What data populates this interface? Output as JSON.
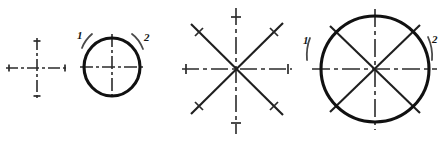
{
  "figure": {
    "background_color": "#ffffff",
    "ink_color": "#111111",
    "center_line_color": "#2b2b2b",
    "hint_arc_color": "#4a4a4a",
    "width": 443,
    "height": 150
  },
  "panels": [
    {
      "id": "panel-1",
      "name": "center-cross",
      "caption": "",
      "center": {
        "x": 37,
        "y": 68
      },
      "horizontal_line": {
        "x1": 6,
        "x2": 68,
        "y": 68
      },
      "vertical_line": {
        "y1": 38,
        "y2": 99,
        "x": 37
      },
      "dash_pattern": "12 3 3 3",
      "ticks": [
        {
          "name": "tick-left",
          "x": 9,
          "y": 68,
          "orientation": "vertical",
          "length": 7
        },
        {
          "name": "tick-right",
          "x": 65,
          "y": 68,
          "orientation": "vertical",
          "length": 7
        },
        {
          "name": "tick-top",
          "x": 37,
          "y": 41,
          "orientation": "horizontal",
          "length": 7
        },
        {
          "name": "tick-bottom",
          "x": 37,
          "y": 96,
          "orientation": "horizontal",
          "length": 7
        }
      ],
      "labels": [],
      "circle": null,
      "diagonals": []
    },
    {
      "id": "panel-2",
      "name": "circle-over-cross",
      "caption": "",
      "center": {
        "x": 112,
        "y": 67
      },
      "horizontal_line": {
        "x1": 80,
        "x2": 146,
        "y": 67
      },
      "vertical_line": {
        "y1": 34,
        "y2": 100,
        "x": 112
      },
      "dash_pattern": "12 3 3 3",
      "ticks": [],
      "circle": {
        "cx": 112,
        "cy": 67,
        "rx": 28,
        "ry": 29
      },
      "diagonals": [],
      "labels": [
        {
          "text": "1",
          "x": 77,
          "y": 39,
          "arc": "left-top"
        },
        {
          "text": "2",
          "x": 144,
          "y": 41,
          "arc": "right-top"
        }
      ]
    },
    {
      "id": "panel-3",
      "name": "eight-ray-star",
      "caption": "",
      "center": {
        "x": 236,
        "y": 69
      },
      "horizontal_line": {
        "x1": 182,
        "x2": 292,
        "y": 69
      },
      "vertical_line": {
        "y1": 8,
        "y2": 134,
        "x": 236
      },
      "dash_pattern": "16 4 4 4",
      "ticks": [
        {
          "name": "tick-left",
          "x": 186,
          "y": 69,
          "orientation": "vertical",
          "length": 10
        },
        {
          "name": "tick-right",
          "x": 288,
          "y": 69,
          "orientation": "vertical",
          "length": 10
        },
        {
          "name": "tick-top",
          "x": 236,
          "y": 17,
          "orientation": "horizontal",
          "length": 10
        },
        {
          "name": "tick-bottom",
          "x": 236,
          "y": 123,
          "orientation": "horizontal",
          "length": 10
        }
      ],
      "circle": null,
      "diagonals": [
        {
          "name": "diagonal-nw-se",
          "x1": 191,
          "y1": 24,
          "x2": 283,
          "y2": 115
        },
        {
          "name": "diagonal-sw-ne",
          "x1": 191,
          "y1": 114,
          "x2": 283,
          "y2": 23
        }
      ],
      "diagonal_ticks": [
        {
          "name": "tick-nw",
          "x": 199,
          "y": 32
        },
        {
          "name": "tick-ne",
          "x": 274,
          "y": 32
        },
        {
          "name": "tick-sw",
          "x": 199,
          "y": 106
        },
        {
          "name": "tick-se",
          "x": 274,
          "y": 106
        }
      ],
      "labels": []
    },
    {
      "id": "panel-4",
      "name": "circle-over-eight-ray-star",
      "caption": "",
      "center": {
        "x": 375,
        "y": 69
      },
      "horizontal_line": {
        "x1": 312,
        "x2": 437,
        "y": 69
      },
      "vertical_line": {
        "y1": 9,
        "y2": 130,
        "x": 375
      },
      "dash_pattern": "16 4 4 4",
      "ticks": [],
      "circle": {
        "cx": 375,
        "cy": 69,
        "rx": 54,
        "ry": 53
      },
      "diagonals": [
        {
          "name": "diagonal-nw-se",
          "x1": 330,
          "y1": 26,
          "x2": 420,
          "y2": 113
        },
        {
          "name": "diagonal-sw-ne",
          "x1": 330,
          "y1": 112,
          "x2": 420,
          "y2": 25
        }
      ],
      "diagonal_ticks": [],
      "labels": [
        {
          "text": "1",
          "x": 305,
          "y": 46,
          "arc": "left-outer"
        },
        {
          "text": "2",
          "x": 433,
          "y": 45,
          "arc": "right-outer"
        }
      ]
    }
  ],
  "stroke_hints": [
    {
      "name": "hint-arc-panel2-left",
      "panel": "panel-2",
      "d": "M 82 48 Q 85 40 92 34"
    },
    {
      "name": "hint-arc-panel2-right",
      "panel": "panel-2",
      "d": "M 132 34 Q 139 39 143 49"
    },
    {
      "name": "hint-arc-panel4-left",
      "panel": "panel-4",
      "d": "M 310 38 Q 306 48 307 60"
    },
    {
      "name": "hint-arc-panel4-right",
      "panel": "panel-4",
      "d": "M 428 37 Q 433 48 432 60"
    }
  ]
}
